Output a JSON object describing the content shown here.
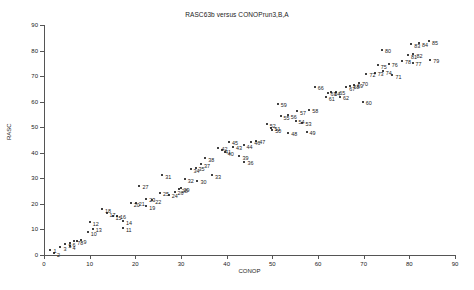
{
  "chart_data": {
    "type": "scatter",
    "title": "RASC63b versus CONOPrun3,B,A",
    "xlabel": "CONOP",
    "ylabel": "RASC",
    "xlim": [
      0,
      90
    ],
    "ylim": [
      0,
      90
    ],
    "xticks": [
      0,
      10,
      20,
      30,
      40,
      50,
      60,
      70,
      80,
      90
    ],
    "yticks": [
      0,
      10,
      20,
      30,
      40,
      50,
      60,
      70,
      80,
      90
    ],
    "grid": false,
    "legend": null,
    "marker_color": "#000000",
    "axis_color": "#555555",
    "points": [
      {
        "label": "1",
        "x": 1.4,
        "y": 2.1
      },
      {
        "label": "2",
        "x": 2.2,
        "y": 0.6
      },
      {
        "label": "3",
        "x": 3.6,
        "y": 3.1
      },
      {
        "label": "4",
        "x": 5.6,
        "y": 3.4
      },
      {
        "label": "5",
        "x": 4.7,
        "y": 4.3
      },
      {
        "label": "6",
        "x": 5.6,
        "y": 4.6
      },
      {
        "label": "7",
        "x": 6.6,
        "y": 5.3
      },
      {
        "label": "8",
        "x": 7.3,
        "y": 5.4
      },
      {
        "label": "9",
        "x": 8.0,
        "y": 5.8
      },
      {
        "label": "10",
        "x": 9.6,
        "y": 9.0
      },
      {
        "label": "11",
        "x": 17.3,
        "y": 10.5
      },
      {
        "label": "12",
        "x": 10.0,
        "y": 12.8
      },
      {
        "label": "13",
        "x": 10.7,
        "y": 10.3
      },
      {
        "label": "14",
        "x": 17.3,
        "y": 13.2
      },
      {
        "label": "15",
        "x": 15.0,
        "y": 15.1
      },
      {
        "label": "16",
        "x": 16.0,
        "y": 15.4
      },
      {
        "label": "17",
        "x": 13.7,
        "y": 16.4
      },
      {
        "label": "18",
        "x": 12.7,
        "y": 17.9
      },
      {
        "label": "19",
        "x": 22.4,
        "y": 19.0
      },
      {
        "label": "20",
        "x": 19.0,
        "y": 20.3
      },
      {
        "label": "21",
        "x": 20.1,
        "y": 20.5
      },
      {
        "label": "22",
        "x": 23.7,
        "y": 21.5
      },
      {
        "label": "23",
        "x": 22.4,
        "y": 22.1
      },
      {
        "label": "24",
        "x": 27.3,
        "y": 23.6
      },
      {
        "label": "25",
        "x": 25.4,
        "y": 24.4
      },
      {
        "label": "26",
        "x": 28.6,
        "y": 24.8
      },
      {
        "label": "27",
        "x": 20.9,
        "y": 27.1
      },
      {
        "label": "28",
        "x": 29.5,
        "y": 25.7
      },
      {
        "label": "29",
        "x": 29.9,
        "y": 26.1
      },
      {
        "label": "30",
        "x": 33.6,
        "y": 29.0
      },
      {
        "label": "31",
        "x": 25.9,
        "y": 31.2
      },
      {
        "label": "32",
        "x": 30.8,
        "y": 29.6
      },
      {
        "label": "33",
        "x": 36.8,
        "y": 31.3
      },
      {
        "label": "34",
        "x": 32.1,
        "y": 33.5
      },
      {
        "label": "35",
        "x": 33.2,
        "y": 34.2
      },
      {
        "label": "36",
        "x": 43.9,
        "y": 36.5
      },
      {
        "label": "37",
        "x": 34.4,
        "y": 35.6
      },
      {
        "label": "38",
        "x": 35.3,
        "y": 37.8
      },
      {
        "label": "39",
        "x": 42.8,
        "y": 38.6
      },
      {
        "label": "40",
        "x": 39.6,
        "y": 40.2
      },
      {
        "label": "41",
        "x": 39.0,
        "y": 40.9
      },
      {
        "label": "42",
        "x": 38.2,
        "y": 41.9
      },
      {
        "label": "43",
        "x": 41.4,
        "y": 42.3
      },
      {
        "label": "44",
        "x": 43.7,
        "y": 42.9
      },
      {
        "label": "45",
        "x": 40.5,
        "y": 44.3
      },
      {
        "label": "46",
        "x": 45.4,
        "y": 44.4
      },
      {
        "label": "47",
        "x": 46.5,
        "y": 44.8
      },
      {
        "label": "48",
        "x": 53.5,
        "y": 47.9
      },
      {
        "label": "49",
        "x": 57.5,
        "y": 48.2
      },
      {
        "label": "50",
        "x": 50.0,
        "y": 49.1
      },
      {
        "label": "51",
        "x": 49.8,
        "y": 49.8
      },
      {
        "label": "52",
        "x": 48.8,
        "y": 51.2
      },
      {
        "label": "53",
        "x": 56.6,
        "y": 51.7
      },
      {
        "label": "54",
        "x": 55.1,
        "y": 52.6
      },
      {
        "label": "55",
        "x": 51.8,
        "y": 54.2
      },
      {
        "label": "56",
        "x": 53.4,
        "y": 54.6
      },
      {
        "label": "57",
        "x": 55.4,
        "y": 56.2
      },
      {
        "label": "58",
        "x": 58.1,
        "y": 56.8
      },
      {
        "label": "59",
        "x": 51.2,
        "y": 59.2
      },
      {
        "label": "60",
        "x": 69.8,
        "y": 59.9
      },
      {
        "label": "61",
        "x": 61.7,
        "y": 61.8
      },
      {
        "label": "62",
        "x": 64.8,
        "y": 61.9
      },
      {
        "label": "63",
        "x": 62.1,
        "y": 63.4
      },
      {
        "label": "64",
        "x": 62.9,
        "y": 63.6
      },
      {
        "label": "65",
        "x": 64.0,
        "y": 63.9
      },
      {
        "label": "66",
        "x": 59.3,
        "y": 65.9
      },
      {
        "label": "67",
        "x": 66.2,
        "y": 65.6
      },
      {
        "label": "68",
        "x": 67.1,
        "y": 66.2
      },
      {
        "label": "69",
        "x": 67.9,
        "y": 66.6
      },
      {
        "label": "70",
        "x": 69.0,
        "y": 67.5
      },
      {
        "label": "71",
        "x": 76.3,
        "y": 70.3
      },
      {
        "label": "72",
        "x": 70.6,
        "y": 70.9
      },
      {
        "label": "73",
        "x": 72.4,
        "y": 71.4
      },
      {
        "label": "74",
        "x": 74.2,
        "y": 71.9
      },
      {
        "label": "75",
        "x": 73.1,
        "y": 74.2
      },
      {
        "label": "76",
        "x": 75.5,
        "y": 74.8
      },
      {
        "label": "77",
        "x": 80.7,
        "y": 75.3
      },
      {
        "label": "78",
        "x": 78.4,
        "y": 76.0
      },
      {
        "label": "79",
        "x": 84.6,
        "y": 76.5
      },
      {
        "label": "80",
        "x": 74.0,
        "y": 80.4
      },
      {
        "label": "81",
        "x": 79.7,
        "y": 78.2
      },
      {
        "label": "82",
        "x": 80.9,
        "y": 78.6
      },
      {
        "label": "83",
        "x": 80.4,
        "y": 82.4
      },
      {
        "label": "84",
        "x": 82.1,
        "y": 82.9
      },
      {
        "label": "85",
        "x": 84.3,
        "y": 83.6
      }
    ]
  }
}
